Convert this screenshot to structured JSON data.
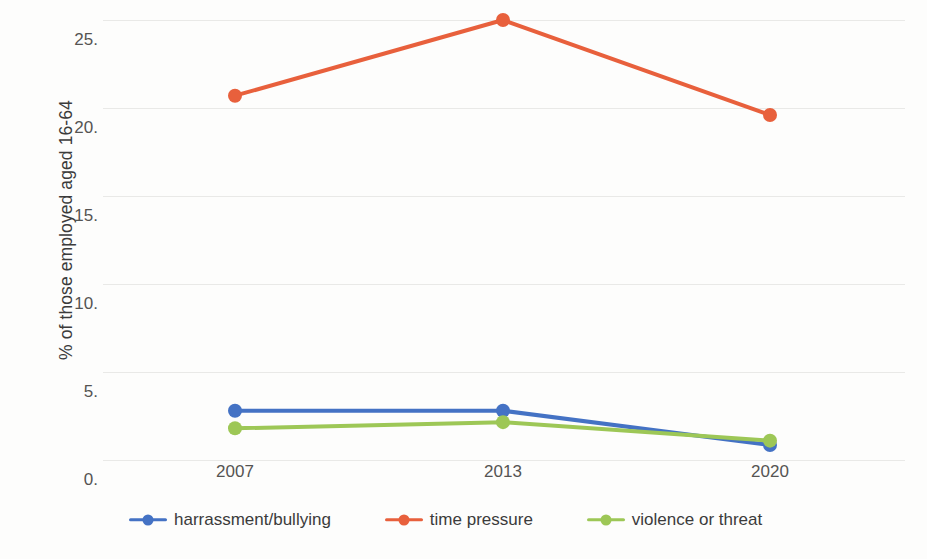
{
  "chart_data": {
    "type": "line",
    "title": "",
    "subtitle": "",
    "xlabel": "",
    "ylabel": "% of those employed aged 16-64",
    "categories": [
      "2007",
      "2013",
      "2020"
    ],
    "series": [
      {
        "name": "harrassment/bullying",
        "color": "#4472C4",
        "values": [
          2.8,
          2.8,
          0.85
        ]
      },
      {
        "name": "time pressure",
        "color": "#E8603C",
        "values": [
          20.7,
          25.0,
          19.6
        ]
      },
      {
        "name": "violence or threat",
        "color": "#9DC756",
        "values": [
          1.8,
          2.15,
          1.1
        ]
      }
    ],
    "ylim": [
      0,
      25
    ],
    "ytick_values": [
      0,
      5,
      10,
      15,
      20,
      25
    ],
    "ytick_labels": [
      "0.",
      "5.",
      "10.",
      "15.",
      "20.",
      "25."
    ],
    "grid": true,
    "grid_axis": "y",
    "legend_position": "bottom",
    "markers": true,
    "marker_shape": "circle",
    "background_color": "#fdfdfc",
    "gridline_color": "#e9e9e7",
    "axis_text_color": "#555452"
  }
}
